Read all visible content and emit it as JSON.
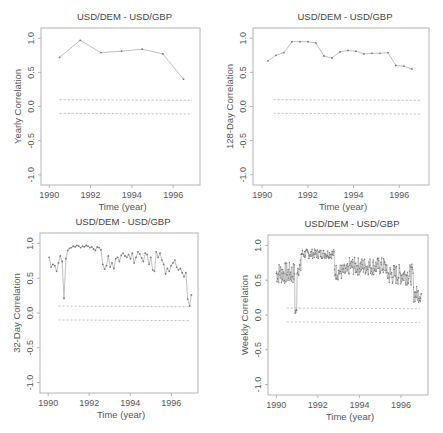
{
  "chart_data": [
    {
      "type": "line",
      "title": "USD/DEM - USD/GBP",
      "xlabel": "Time (year)",
      "ylabel": "Yearly Correlation",
      "xlim": [
        1989.6,
        1997.3
      ],
      "ylim": [
        -1.15,
        1.15
      ],
      "xticks": [
        1990,
        1992,
        1994,
        1996
      ],
      "xtick_labels": [
        "1990",
        "1992",
        "1994",
        "1996"
      ],
      "yticks": [
        1.0,
        0.5,
        0.0,
        -0.5,
        -1.0
      ],
      "ytick_labels": [
        "1.0",
        "0.5",
        "0.0",
        "-0.5",
        "-1.0"
      ],
      "grid": false,
      "confidence_bands": [
        0.1,
        -0.1
      ],
      "series": [
        {
          "name": "Yearly Correlation",
          "x": [
            1990.5,
            1991.5,
            1992.5,
            1993.5,
            1994.5,
            1995.5,
            1996.5
          ],
          "y": [
            0.72,
            0.97,
            0.79,
            0.81,
            0.84,
            0.77,
            0.4
          ]
        }
      ]
    },
    {
      "type": "line",
      "title": "USD/DEM - USD/GBP",
      "xlabel": "Time (year)",
      "ylabel": "128-Day Correlation",
      "xlim": [
        1989.6,
        1997.3
      ],
      "ylim": [
        -1.15,
        1.15
      ],
      "xticks": [
        1990,
        1992,
        1994,
        1996
      ],
      "xtick_labels": [
        "1990",
        "1992",
        "1994",
        "1996"
      ],
      "yticks": [
        1.0,
        0.5,
        0.0,
        -0.5,
        -1.0
      ],
      "ytick_labels": [
        "1.0",
        "0.5",
        "0.0",
        "-0.5",
        "-1.0"
      ],
      "grid": false,
      "confidence_bands": [
        0.1,
        -0.1
      ],
      "series": [
        {
          "name": "128-Day Correlation",
          "x": [
            1990.25,
            1990.6,
            1990.95,
            1991.3,
            1991.65,
            1992.0,
            1992.35,
            1992.7,
            1993.05,
            1993.4,
            1993.75,
            1994.1,
            1994.45,
            1994.8,
            1995.15,
            1995.5,
            1995.85,
            1996.2,
            1996.55
          ],
          "y": [
            0.67,
            0.75,
            0.79,
            0.95,
            0.95,
            0.95,
            0.93,
            0.74,
            0.71,
            0.8,
            0.82,
            0.81,
            0.77,
            0.78,
            0.78,
            0.79,
            0.6,
            0.59,
            0.55
          ]
        }
      ]
    },
    {
      "type": "line",
      "title": "USD/DEM - USD/GBP",
      "xlabel": "Time (year)",
      "ylabel": "32-Day Correlation",
      "xlim": [
        1989.6,
        1997.3
      ],
      "ylim": [
        -1.15,
        1.15
      ],
      "xticks": [
        1990,
        1992,
        1994,
        1996
      ],
      "xtick_labels": [
        "1990",
        "1992",
        "1994",
        "1996"
      ],
      "yticks": [
        1.0,
        0.5,
        0.0,
        -0.5,
        -1.0
      ],
      "ytick_labels": [
        "1.0",
        "0.5",
        "0.0",
        "-0.5",
        "-1.0"
      ],
      "grid": false,
      "confidence_bands": [
        0.1,
        -0.1
      ],
      "series": [
        {
          "name": "32-Day Correlation",
          "x": [
            1990.05,
            1990.14,
            1990.23,
            1990.32,
            1990.41,
            1990.5,
            1990.59,
            1990.68,
            1990.77,
            1990.86,
            1990.95,
            1991.04,
            1991.13,
            1991.22,
            1991.31,
            1991.4,
            1991.49,
            1991.58,
            1991.67,
            1991.76,
            1991.85,
            1991.94,
            1992.03,
            1992.12,
            1992.21,
            1992.3,
            1992.39,
            1992.48,
            1992.57,
            1992.66,
            1992.75,
            1992.84,
            1992.93,
            1993.02,
            1993.11,
            1993.2,
            1993.29,
            1993.38,
            1993.47,
            1993.56,
            1993.65,
            1993.74,
            1993.83,
            1993.92,
            1994.01,
            1994.1,
            1994.19,
            1994.28,
            1994.37,
            1994.46,
            1994.55,
            1994.64,
            1994.73,
            1994.82,
            1994.91,
            1995.0,
            1995.09,
            1995.18,
            1995.27,
            1995.36,
            1995.45,
            1995.54,
            1995.63,
            1995.72,
            1995.81,
            1995.9,
            1995.99,
            1996.08,
            1996.17,
            1996.26,
            1996.35,
            1996.44,
            1996.53,
            1996.62,
            1996.71,
            1996.8,
            1996.89,
            1996.98
          ],
          "y": [
            0.8,
            0.66,
            0.7,
            0.68,
            0.6,
            0.72,
            0.82,
            0.74,
            0.21,
            0.78,
            0.9,
            0.93,
            0.94,
            0.96,
            0.95,
            0.97,
            0.96,
            0.94,
            0.96,
            0.95,
            0.97,
            0.96,
            0.94,
            0.95,
            0.92,
            0.9,
            0.95,
            0.94,
            0.91,
            0.7,
            0.63,
            0.68,
            0.82,
            0.66,
            0.72,
            0.64,
            0.78,
            0.8,
            0.74,
            0.83,
            0.86,
            0.82,
            0.8,
            0.84,
            0.78,
            0.86,
            0.72,
            0.8,
            0.88,
            0.85,
            0.79,
            0.74,
            0.86,
            0.84,
            0.7,
            0.8,
            0.62,
            0.6,
            0.88,
            0.8,
            0.86,
            0.76,
            0.7,
            0.56,
            0.64,
            0.6,
            0.68,
            0.72,
            0.76,
            0.66,
            0.62,
            0.64,
            0.58,
            0.52,
            0.58,
            0.2,
            0.1,
            0.26
          ]
        }
      ]
    },
    {
      "type": "line",
      "title": "USD/DEM - USD/GBP",
      "xlabel": "Time (year)",
      "ylabel": "Weekly Correlation",
      "xlim": [
        1989.6,
        1997.3
      ],
      "ylim": [
        -1.15,
        1.15
      ],
      "xticks": [
        1990,
        1992,
        1994,
        1996
      ],
      "xtick_labels": [
        "1990",
        "1992",
        "1994",
        "1996"
      ],
      "yticks": [
        1.0,
        0.5,
        0.0,
        -0.5,
        -1.0
      ],
      "ytick_labels": [
        "1.0",
        "0.5",
        "0.0",
        "-0.5",
        "-1.0"
      ],
      "grid": false,
      "confidence_bands": [
        0.1,
        -0.1
      ],
      "series": [
        {
          "name": "Weekly Correlation",
          "note": "approximately weekly observations, noisy; envelope shown",
          "segments": [
            {
              "x0": 1990.0,
              "x1": 1990.9,
              "mean": 0.6,
              "spread": 0.16
            },
            {
              "x0": 1990.9,
              "x1": 1991.0,
              "mean": 0.05,
              "spread": 0.05
            },
            {
              "x0": 1991.0,
              "x1": 1991.2,
              "mean": 0.68,
              "spread": 0.12
            },
            {
              "x0": 1991.2,
              "x1": 1992.8,
              "mean": 0.88,
              "spread": 0.07
            },
            {
              "x0": 1992.8,
              "x1": 1993.5,
              "mean": 0.62,
              "spread": 0.12
            },
            {
              "x0": 1993.5,
              "x1": 1995.3,
              "mean": 0.7,
              "spread": 0.13
            },
            {
              "x0": 1995.3,
              "x1": 1996.6,
              "mean": 0.58,
              "spread": 0.15
            },
            {
              "x0": 1996.6,
              "x1": 1997.0,
              "mean": 0.3,
              "spread": 0.12
            }
          ]
        }
      ]
    }
  ]
}
